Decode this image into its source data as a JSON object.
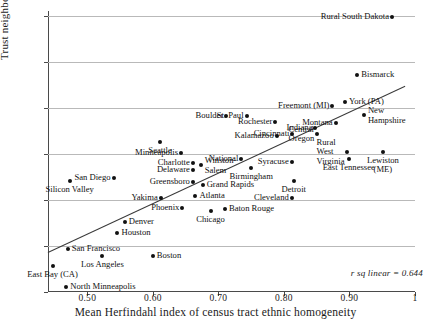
{
  "chart_data": {
    "type": "scatter",
    "title": "",
    "xlabel": "Mean Herfindahl index of census tract ethnic homogeneity",
    "ylabel": "Trust neighbours 'a lot', %",
    "xlim": [
      0.44,
      1.0
    ],
    "ylim": [
      20,
      81
    ],
    "xticks": [
      "0.50",
      "0.60",
      "0.70",
      "0.80",
      "0.90",
      "1"
    ],
    "xtick_values": [
      0.5,
      0.6,
      0.7,
      0.8,
      0.9,
      1.0
    ],
    "yticks": [
      "20",
      "30",
      "40",
      "50",
      "60",
      "70",
      "80"
    ],
    "ytick_values": [
      20,
      30,
      40,
      50,
      60,
      70,
      80
    ],
    "grid": "horizontal",
    "legend": "none",
    "annotation": "r sq linear = 0.644",
    "r_squared": 0.644,
    "fit_line": {
      "x0": 0.44,
      "y0": 28.6,
      "x1": 0.985,
      "y1": 64.7
    },
    "points": [
      {
        "label": "Rural South Dakota",
        "x": 0.965,
        "y": 79.7,
        "pos": "r"
      },
      {
        "label": "Bismarck",
        "x": 0.912,
        "y": 67.2,
        "pos": "l"
      },
      {
        "label": "York (PA)",
        "x": 0.893,
        "y": 61.2,
        "pos": "l"
      },
      {
        "label": "Freemont (MI)",
        "x": 0.874,
        "y": 60.4,
        "pos": "r"
      },
      {
        "label": "New\nHampshire",
        "x": 0.922,
        "y": 58.4,
        "pos": "l"
      },
      {
        "label": "Montana",
        "x": 0.879,
        "y": 56.6,
        "pos": "r"
      },
      {
        "label": "St. Paul",
        "x": 0.743,
        "y": 58.2,
        "pos": "r"
      },
      {
        "label": "Boulder",
        "x": 0.712,
        "y": 58.2,
        "pos": "r"
      },
      {
        "label": "Rochester",
        "x": 0.787,
        "y": 56.8,
        "pos": "r"
      },
      {
        "label": "Indiana",
        "x": 0.848,
        "y": 55.5,
        "pos": "r"
      },
      {
        "label": "Kalamazoo",
        "x": 0.789,
        "y": 53.8,
        "pos": "r"
      },
      {
        "label": "Central\nOregon",
        "x": 0.851,
        "y": 54.3,
        "pos": "r"
      },
      {
        "label": "Cincinnati",
        "x": 0.813,
        "y": 54.2,
        "pos": "r"
      },
      {
        "label": "Seattle",
        "x": 0.611,
        "y": 52.6,
        "pos": "c"
      },
      {
        "label": "Rural\nWest\nVirginia",
        "x": 0.897,
        "y": 50.4,
        "pos": "r"
      },
      {
        "label": "Lewiston\n(ME)",
        "x": 0.951,
        "y": 50.4,
        "pos": "c"
      },
      {
        "label": "Minneapolis",
        "x": 0.643,
        "y": 50.2,
        "pos": "r"
      },
      {
        "label": "National",
        "x": 0.735,
        "y": 48.8,
        "pos": "r"
      },
      {
        "label": "Charlotte",
        "x": 0.661,
        "y": 48.1,
        "pos": "r"
      },
      {
        "label": "East Tennessee",
        "x": 0.899,
        "y": 48.8,
        "pos": "c"
      },
      {
        "label": "Syracuse",
        "x": 0.812,
        "y": 48.2,
        "pos": "r"
      },
      {
        "label": "Winston-\nSalem",
        "x": 0.673,
        "y": 47.5,
        "pos": "l"
      },
      {
        "label": "Delaware",
        "x": 0.661,
        "y": 46.4,
        "pos": "r"
      },
      {
        "label": "Birmingham",
        "x": 0.75,
        "y": 46.9,
        "pos": "c"
      },
      {
        "label": "San Diego",
        "x": 0.54,
        "y": 44.7,
        "pos": "r"
      },
      {
        "label": "Silicon Valley",
        "x": 0.473,
        "y": 44.2,
        "pos": "c"
      },
      {
        "label": "Greensboro",
        "x": 0.661,
        "y": 43.9,
        "pos": "r"
      },
      {
        "label": "Grand Rapids",
        "x": 0.676,
        "y": 43.3,
        "pos": "l"
      },
      {
        "label": "Detroit",
        "x": 0.815,
        "y": 44.2,
        "pos": "c"
      },
      {
        "label": "Yakima",
        "x": 0.612,
        "y": 40.5,
        "pos": "r"
      },
      {
        "label": "Atlanta",
        "x": 0.665,
        "y": 40.8,
        "pos": "l"
      },
      {
        "label": "Cleveland",
        "x": 0.812,
        "y": 40.3,
        "pos": "r"
      },
      {
        "label": "Phoenix",
        "x": 0.645,
        "y": 38.2,
        "pos": "r"
      },
      {
        "label": "Baton Rouge",
        "x": 0.71,
        "y": 38.0,
        "pos": "l"
      },
      {
        "label": "Chicago",
        "x": 0.688,
        "y": 37.5,
        "pos": "c"
      },
      {
        "label": "Denver",
        "x": 0.557,
        "y": 35.1,
        "pos": "l"
      },
      {
        "label": "Houston",
        "x": 0.546,
        "y": 32.7,
        "pos": "l"
      },
      {
        "label": "San Francisco",
        "x": 0.47,
        "y": 29.4,
        "pos": "l"
      },
      {
        "label": "Boston",
        "x": 0.6,
        "y": 27.9,
        "pos": "l"
      },
      {
        "label": "Los Angeles",
        "x": 0.523,
        "y": 27.8,
        "pos": "c"
      },
      {
        "label": "East Bay (CA)",
        "x": 0.447,
        "y": 25.6,
        "pos": "c"
      },
      {
        "label": "North Minneapolis",
        "x": 0.468,
        "y": 21.1,
        "pos": "l"
      }
    ]
  }
}
